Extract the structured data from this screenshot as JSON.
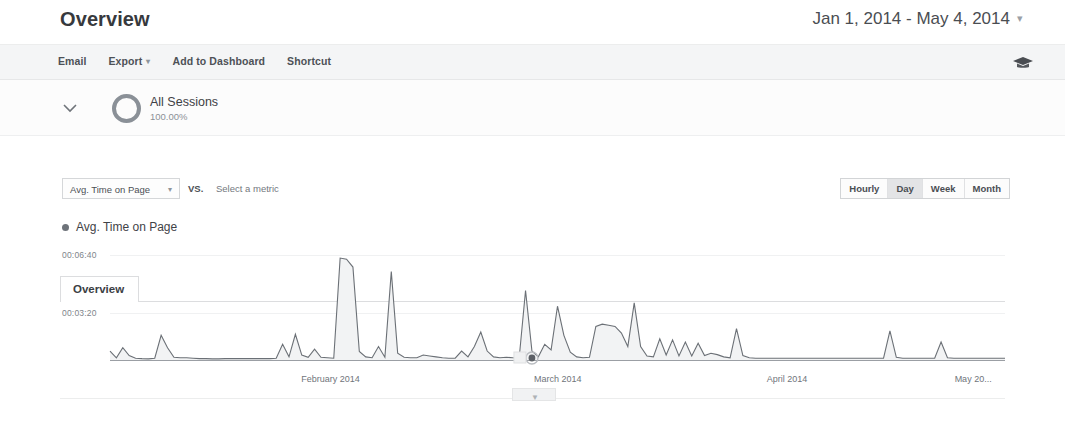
{
  "header": {
    "title": "Overview",
    "date_range": "Jan 1, 2014 - May 4, 2014",
    "date_caret": "▾"
  },
  "toolbar": {
    "items": [
      {
        "label": "Email",
        "caret": ""
      },
      {
        "label": "Export",
        "caret": "▾"
      },
      {
        "label": "Add to Dashboard",
        "caret": ""
      },
      {
        "label": "Shortcut",
        "caret": ""
      }
    ],
    "share_icon": "graduation-cap-icon"
  },
  "segment": {
    "chevron_icon": "chevron-down-icon",
    "donut_icon": "segment-donut-icon",
    "name": "All Sessions",
    "percent": "100.00%"
  },
  "tabs": [
    {
      "label": "Overview",
      "active": true
    }
  ],
  "controls": {
    "metric_selected": "Avg. Time on Page",
    "metric_caret": "▾",
    "vs_label": "VS.",
    "select_metric_placeholder": "Select a metric",
    "granularity": [
      {
        "label": "Hourly",
        "active": false
      },
      {
        "label": "Day",
        "active": true
      },
      {
        "label": "Week",
        "active": false
      },
      {
        "label": "Month",
        "active": false
      }
    ]
  },
  "legend": [
    {
      "label": "Avg. Time on Page",
      "color": "#6e737a"
    }
  ],
  "chart_data": {
    "type": "area",
    "title": "Avg. Time on Page",
    "xlabel": "",
    "ylabel": "Avg. Time on Page",
    "grid": true,
    "legend_position": "top-left",
    "line_color": "#6b7076",
    "fill_color": "#f2f3f4",
    "y_ticks": [
      "00:03:20",
      "00:06:40"
    ],
    "y_tick_seconds": [
      200,
      400
    ],
    "ylim_seconds": [
      0,
      500
    ],
    "x_ticks": [
      "February 2014",
      "March 2014",
      "April 2014",
      "May 20..."
    ],
    "x_tick_positions": [
      0.245,
      0.505,
      0.765,
      0.975
    ],
    "selected_point_index": 66,
    "values_seconds": [
      40,
      10,
      55,
      20,
      8,
      6,
      5,
      8,
      110,
      55,
      12,
      10,
      10,
      8,
      6,
      6,
      5,
      5,
      6,
      6,
      6,
      6,
      6,
      6,
      6,
      6,
      8,
      70,
      14,
      115,
      22,
      12,
      48,
      12,
      10,
      8,
      455,
      450,
      415,
      38,
      14,
      10,
      60,
      12,
      395,
      30,
      12,
      10,
      10,
      22,
      18,
      14,
      10,
      8,
      8,
      40,
      14,
      60,
      125,
      40,
      14,
      10,
      12,
      10,
      8,
      310,
      40,
      14,
      70,
      45,
      240,
      110,
      35,
      14,
      10,
      12,
      150,
      160,
      155,
      150,
      120,
      60,
      255,
      60,
      18,
      14,
      95,
      22,
      90,
      18,
      80,
      18,
      75,
      20,
      30,
      24,
      14,
      10,
      140,
      20,
      10,
      8,
      8,
      8,
      8,
      8,
      8,
      8,
      8,
      8,
      8,
      8,
      8,
      8,
      8,
      8,
      8,
      8,
      8,
      8,
      8,
      8,
      130,
      12,
      8,
      8,
      8,
      8,
      8,
      8,
      80,
      10,
      8,
      8,
      8,
      8,
      8,
      8,
      8,
      8,
      8
    ]
  },
  "scrubber": {
    "handle_icon": "scrubber-handle-icon",
    "marker_icon": "selected-point-marker"
  }
}
